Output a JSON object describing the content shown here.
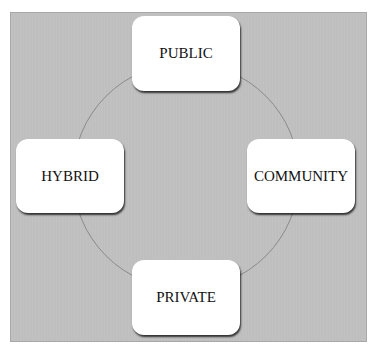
{
  "diagram": {
    "type": "cycle",
    "nodes": [
      {
        "id": "public",
        "label": "PUBLIC",
        "position": "top"
      },
      {
        "id": "community",
        "label": "COMMUNITY",
        "position": "right"
      },
      {
        "id": "private",
        "label": "PRIVATE",
        "position": "bottom"
      },
      {
        "id": "hybrid",
        "label": "HYBRID",
        "position": "left"
      }
    ],
    "colors": {
      "background": "#c0c0c0",
      "node_fill": "#ffffff",
      "ring": "#8a8a8a",
      "text": "#111111"
    }
  }
}
